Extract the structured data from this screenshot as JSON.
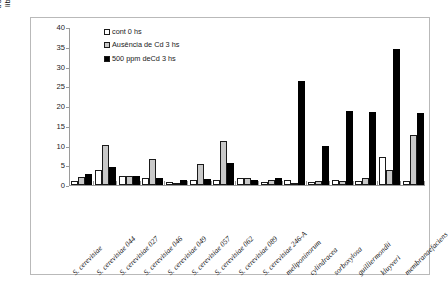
{
  "chart_data": {
    "type": "bar",
    "title": "",
    "xlabel": "",
    "ylabel": "trealose ( moles de glicose\nliberada/g de peso úmido)",
    "ylim": [
      0,
      40
    ],
    "yticks": [
      0,
      5,
      10,
      15,
      20,
      25,
      30,
      35,
      40
    ],
    "grid": false,
    "legend_position": "top-left inside plot",
    "categories": [
      "S. cerevisiae",
      "S. cerevisiae 044",
      "S. cerevisiae 027",
      "S. cerevisiae 046",
      "S. cerevisiae 049",
      "S. cerevisiae 057",
      "S. cerevisiae 062",
      "S. cerevisiae 089",
      "S. cerevisiae 246-A",
      "meliponinorum",
      "cylindracea",
      "sorboxylosa",
      "guilliermondii",
      "kluyveri",
      "membranaefaciens"
    ],
    "categories_plotted": [
      "S. cerevisiae",
      "S. cerevisiae 044",
      "S. cerevisiae 027",
      "S. cerevisiae 046",
      "S. cerevisiae 049",
      "S. cerevisiae 057",
      "S. cerevisiae 062",
      "S. cerevisiae 089",
      "S. cerevisiae 246-A",
      "meliponinorum",
      "cylindracea",
      "sorboxylosa",
      "guilliermondii",
      "kluyveri",
      "membranaefaciens"
    ],
    "series": [
      {
        "name": "cont 0 hs",
        "color": "#ffffff",
        "values": [
          0.9,
          3.7,
          2.3,
          1.9,
          0.8,
          1.3,
          1.3,
          1.7,
          0.8,
          1.3,
          0.7,
          1.2,
          1.1,
          7.2,
          0.9
        ]
      },
      {
        "name": "Ausência de Cd 3 hs",
        "color": "#c9c9c9",
        "values": [
          2.1,
          10.1,
          2.3,
          6.6,
          0.6,
          5.2,
          11.2,
          1.8,
          1.3,
          0.5,
          1.0,
          0.9,
          1.9,
          3.7,
          12.6
        ]
      },
      {
        "name": "500 ppm deCd 3 hs",
        "color": "#000000",
        "values": [
          2.8,
          4.5,
          2.3,
          1.9,
          1.3,
          1.4,
          5.5,
          1.3,
          1.7,
          26.4,
          9.9,
          18.8,
          18.5,
          34.4,
          18.2
        ]
      }
    ]
  },
  "legend": {
    "items": [
      {
        "label": "cont 0 hs",
        "swatch": "white"
      },
      {
        "label": "Ausência de Cd 3 hs",
        "swatch": "gray"
      },
      {
        "label": "500 ppm deCd 3 hs",
        "swatch": "black"
      }
    ]
  }
}
